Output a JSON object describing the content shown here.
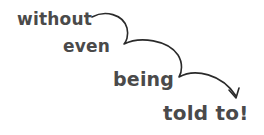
{
  "phrase": {
    "lines": [
      "without",
      "even",
      "being",
      "told to!"
    ]
  },
  "colors": {
    "text": "#4a4a4a",
    "arrow": "#2a2a2a",
    "background": "#ffffff"
  },
  "icons": {
    "arrow": "hand-drawn-curved-arrow"
  }
}
